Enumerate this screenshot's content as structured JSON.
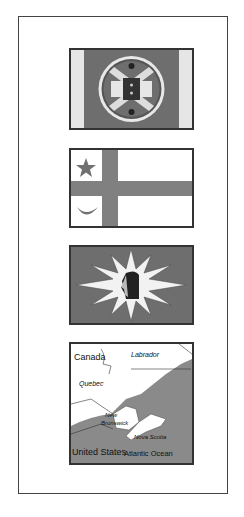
{
  "figure": {
    "panels": [
      {
        "id": "flag-1",
        "description": "Flag with circular emblem on dark field"
      },
      {
        "id": "flag-2",
        "description": "White flag with gray cross, star and crescent"
      },
      {
        "id": "flag-3",
        "description": "Dark flag with white sunburst and profile head"
      },
      {
        "id": "map",
        "description": "Map of Maritime region"
      }
    ],
    "map": {
      "labels": {
        "canada": "Canada",
        "labrador": "Labrador",
        "quebec": "Quebec",
        "new_brunswick_1": "New",
        "new_brunswick_2": "Brunswick",
        "nova_scotia": "Nova Scotia",
        "united_states": "United States",
        "atlantic_ocean": "Atlantic Ocean"
      }
    },
    "colors": {
      "dark": "#707070",
      "light": "#ffffff",
      "border": "#333333",
      "mid": "#9a9a9a"
    }
  }
}
